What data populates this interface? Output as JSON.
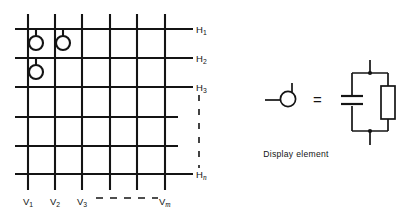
{
  "figure": {
    "colors": {
      "line": "#141414",
      "background": "#ffffff",
      "text": "#141414"
    },
    "matrix": {
      "name": "display-matrix",
      "rows": [
        {
          "id": "H1",
          "label": "H",
          "subscript": "1",
          "subscript_italic": false,
          "y": 29
        },
        {
          "id": "H2",
          "label": "H",
          "subscript": "2",
          "subscript_italic": false,
          "y": 58
        },
        {
          "id": "H3",
          "label": "H",
          "subscript": "3",
          "subscript_italic": false,
          "y": 87
        },
        {
          "id": "H4",
          "label": "",
          "subscript": "",
          "subscript_italic": false,
          "y": 117
        },
        {
          "id": "H5",
          "label": "",
          "subscript": "",
          "subscript_italic": false,
          "y": 146
        },
        {
          "id": "Hn",
          "label": "H",
          "subscript": "n",
          "subscript_italic": true,
          "y": 174
        }
      ],
      "columns": [
        {
          "id": "V1",
          "label": "V",
          "subscript": "1",
          "subscript_italic": false,
          "x": 28
        },
        {
          "id": "V2",
          "label": "V",
          "subscript": "2",
          "subscript_italic": false,
          "x": 55
        },
        {
          "id": "V3",
          "label": "V",
          "subscript": "3",
          "subscript_italic": false,
          "x": 82
        },
        {
          "id": "V4",
          "label": "",
          "subscript": "",
          "subscript_italic": false,
          "x": 110
        },
        {
          "id": "V5",
          "label": "",
          "subscript": "",
          "subscript_italic": false,
          "x": 137
        },
        {
          "id": "Vm",
          "label": "V",
          "subscript": "m",
          "subscript_italic": true,
          "x": 165
        }
      ],
      "elements": [
        {
          "name": "display-element-v1-h1",
          "column": "V1",
          "row": "H1",
          "cx": 36,
          "cy": 43
        },
        {
          "name": "display-element-v2-h1",
          "column": "V2",
          "row": "H1",
          "cx": 63,
          "cy": 43
        },
        {
          "name": "display-element-v1-h2",
          "column": "V1",
          "row": "H2",
          "cx": 36,
          "cy": 72
        }
      ],
      "continuation_rows": "vertical dashes between H3 and Hn",
      "continuation_columns": "horizontal dashes between V3 and Vm"
    },
    "legend": {
      "name": "display-element-legend",
      "symbol_name": "display-element-symbol",
      "equals": "=",
      "caption": "Display element",
      "circuit": {
        "name": "equivalent-circuit",
        "components": [
          {
            "name": "capacitor",
            "type": "capacitor",
            "branch": "left"
          },
          {
            "name": "resistor",
            "type": "resistor",
            "branch": "right"
          }
        ],
        "terminals": [
          "top",
          "bottom"
        ],
        "junction_dots": 2
      }
    }
  }
}
